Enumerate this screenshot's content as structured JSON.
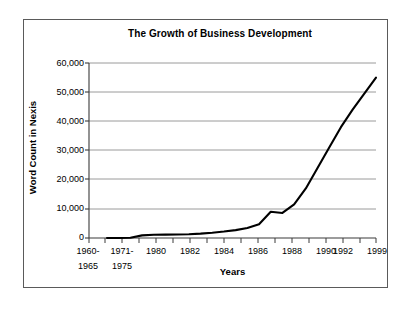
{
  "figure": {
    "title": "The Growth of Business Development",
    "background": "#ffffff",
    "border_color": "#5a5a5a",
    "line_color": "#000000",
    "grid_color": "#9a9a9a",
    "axis_color": "#3a3a3a"
  },
  "axes": {
    "ylabel": "Word Count in Nexis",
    "xlabel": "Years",
    "ytick_labels": [
      "60,000",
      "50,000",
      "40,000",
      "30,000",
      "20,000",
      "10,000",
      "0"
    ],
    "xtick_labels_row1": [
      "1960-",
      "1971-",
      "1980",
      "1982",
      "1984",
      "1986",
      "1988",
      "1990",
      "1992",
      "1999"
    ],
    "xtick_labels_row2": [
      "1965",
      "1975",
      "",
      "",
      "",
      "",
      "",
      "",
      "",
      ""
    ]
  },
  "chart_data": {
    "type": "line",
    "title": "The Growth of Business Development",
    "xlabel": "Years",
    "ylabel": "Word Count in Nexis",
    "ylim": [
      0,
      60000
    ],
    "yticks": [
      0,
      10000,
      20000,
      30000,
      40000,
      50000,
      60000
    ],
    "ytick_labels": [
      "0",
      "10,000",
      "20,000",
      "30,000",
      "40,000",
      "50,000",
      "60,000"
    ],
    "grid": "horizontal",
    "legend": "none",
    "categories": [
      "1960-1965",
      "1966-1970",
      "1971-1975",
      "1976-1979",
      "1980",
      "1981",
      "1982",
      "1983",
      "1984",
      "1985",
      "1986",
      "1987",
      "1988",
      "1989",
      "1990",
      "1991",
      "1992",
      "1993",
      "1994",
      "1995",
      "1996",
      "1997",
      "1998",
      "1999"
    ],
    "xtick_labeled": [
      "1960-1965",
      "1971-1975",
      "1980",
      "1982",
      "1984",
      "1986",
      "1988",
      "1990",
      "1992",
      "1999"
    ],
    "series": [
      {
        "name": "Word Count in Nexis",
        "values": [
          0,
          0,
          100,
          900,
          1100,
          1150,
          1200,
          1300,
          1500,
          1800,
          2200,
          2700,
          3400,
          4700,
          9000,
          8600,
          11500,
          17000,
          24000,
          31000,
          38000,
          44000,
          49500,
          55000
        ]
      }
    ],
    "annotations": [
      "Flat near zero through the early 1970s",
      "Gradual rise through the 1980s",
      "Local peak near 9,000 around 1990 followed by a slight dip",
      "Steep exponential growth after 1992 reaching about 55,000 in 1999"
    ]
  }
}
